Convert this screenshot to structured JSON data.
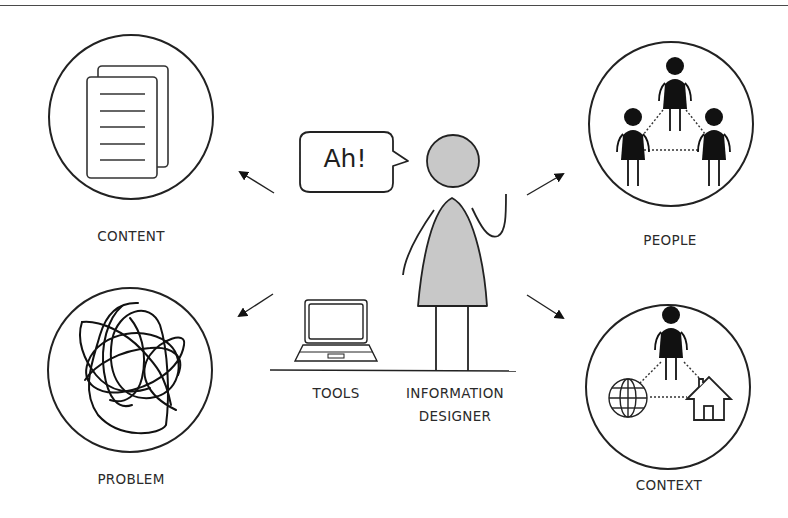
{
  "diagram": {
    "type": "concept-diagram",
    "center": {
      "figure": "information-designer",
      "speech_bubble": "Ah!",
      "label_line1": "INFORMATION",
      "label_line2": "DESIGNER",
      "tool_label": "TOOLS"
    },
    "nodes": [
      {
        "id": "content",
        "label": "CONTENT",
        "icon": "documents-icon",
        "position": "top-left"
      },
      {
        "id": "people",
        "label": "PEOPLE",
        "icon": "people-network-icon",
        "position": "top-right"
      },
      {
        "id": "problem",
        "label": "PROBLEM",
        "icon": "scribble-icon",
        "position": "bottom-left"
      },
      {
        "id": "context",
        "label": "CONTEXT",
        "icon": "person-globe-house-icon",
        "position": "bottom-right"
      }
    ],
    "colors": {
      "stroke": "#222222",
      "figure_fill": "#c8c8c8",
      "icon_fill": "#111111",
      "background": "#ffffff"
    }
  }
}
